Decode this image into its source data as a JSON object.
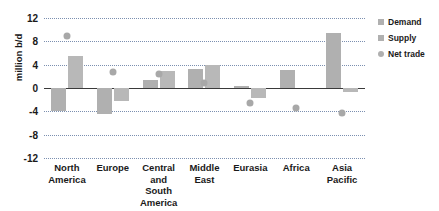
{
  "chart_data": {
    "type": "bar",
    "title": "",
    "xlabel": "",
    "ylabel": "million b/d",
    "ylim": [
      -12,
      12
    ],
    "yticks": [
      12,
      8,
      4,
      0,
      -4,
      -8,
      -12
    ],
    "ytick_labels": [
      "12",
      "8",
      "4",
      "0",
      "-4",
      "-8",
      "-12"
    ],
    "grid": true,
    "legend_position": "right",
    "categories": [
      "North America",
      "Europe",
      "Central and South America",
      "Middle East",
      "Eurasia",
      "Africa",
      "Asia Pacific"
    ],
    "category_lines": [
      [
        "North",
        "America"
      ],
      [
        "Europe"
      ],
      [
        "Central",
        "and South",
        "America"
      ],
      [
        "Middle",
        "East"
      ],
      [
        "Eurasia"
      ],
      [
        "Africa"
      ],
      [
        "Asia",
        "Pacific"
      ]
    ],
    "series": [
      {
        "name": "Demand",
        "marker": "bar",
        "color": "#b0b0b0",
        "values": [
          -4.0,
          -4.5,
          1.3,
          3.2,
          0.4,
          3.1,
          9.5
        ]
      },
      {
        "name": "Supply",
        "marker": "bar",
        "color": "#b8b8b8",
        "values": [
          5.5,
          -2.2,
          2.9,
          3.9,
          -1.7,
          0.0,
          -0.6
        ]
      },
      {
        "name": "Net trade",
        "marker": "dot",
        "color": "#a8a8a8",
        "values": [
          9.0,
          2.8,
          2.4,
          0.9,
          -2.6,
          -3.5,
          -4.3
        ]
      }
    ]
  },
  "legend": {
    "items": [
      {
        "label": "Demand",
        "shape": "square"
      },
      {
        "label": "Supply",
        "shape": "square"
      },
      {
        "label": "Net trade",
        "shape": "circle"
      }
    ]
  }
}
